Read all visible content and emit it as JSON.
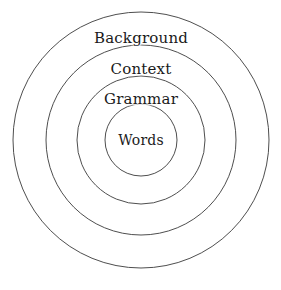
{
  "diagram": {
    "type": "concentric-circles",
    "title": "",
    "background_color": "#ffffff",
    "stroke_color": "#3a3a3a",
    "text_color": "#1a1a1a",
    "center": {
      "x": 141,
      "y": 140
    },
    "rings": [
      {
        "label": "Background",
        "level": 1,
        "radius": 128,
        "label_x": 141,
        "label_y": 38
      },
      {
        "label": "Context",
        "level": 2,
        "radius": 95,
        "label_x": 141,
        "label_y": 69
      },
      {
        "label": "Grammar",
        "level": 3,
        "radius": 64,
        "label_x": 141,
        "label_y": 99
      },
      {
        "label": "Words",
        "level": 4,
        "radius": 36,
        "label_x": 141,
        "label_y": 140
      }
    ]
  }
}
